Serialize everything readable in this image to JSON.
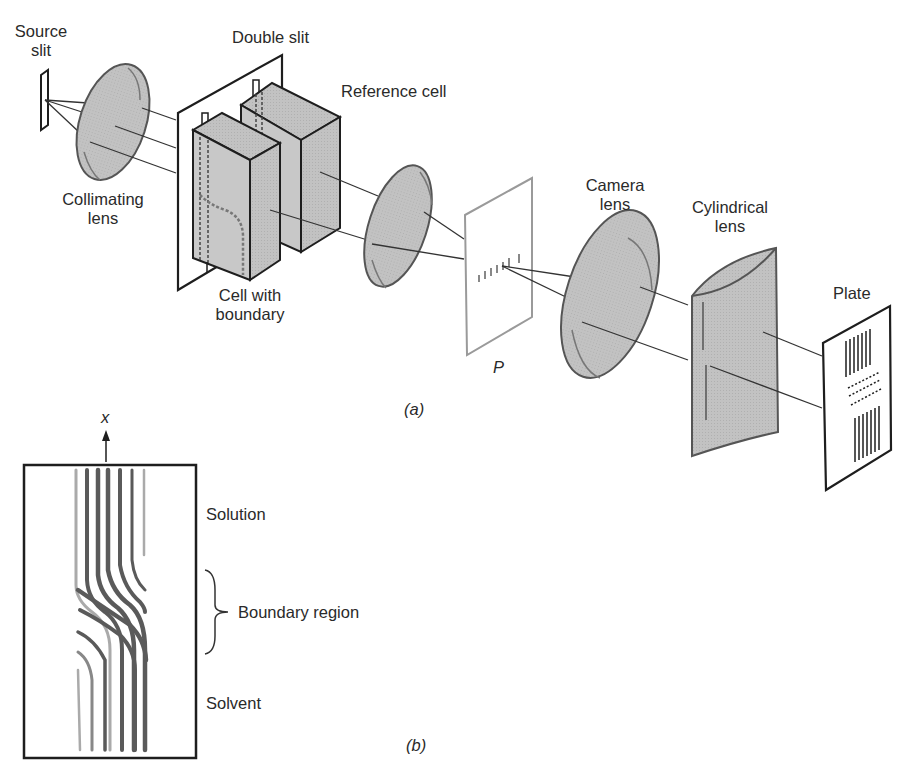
{
  "figure": {
    "part_a": {
      "caption": "(a)",
      "labels": {
        "source_slit": [
          "Source",
          "slit"
        ],
        "double_slit": "Double slit",
        "reference_cell": "Reference cell",
        "collimating_lens": [
          "Collimating",
          "lens"
        ],
        "cell_with_boundary": [
          "Cell with",
          "boundary"
        ],
        "plane_p": "P",
        "camera_lens": [
          "Camera",
          "lens"
        ],
        "cylindrical_lens": [
          "Cylindrical",
          "lens"
        ],
        "plate": "Plate"
      }
    },
    "part_b": {
      "caption": "(b)",
      "axis_label": "x",
      "labels": {
        "solution": "Solution",
        "boundary_region": "Boundary region",
        "solvent": "Solvent"
      }
    }
  },
  "colors": {
    "lens_fill": "#bdbdbd",
    "cell_fill": "#c4c4c4",
    "line": "#1e1e1e",
    "fringe": "#555555"
  }
}
